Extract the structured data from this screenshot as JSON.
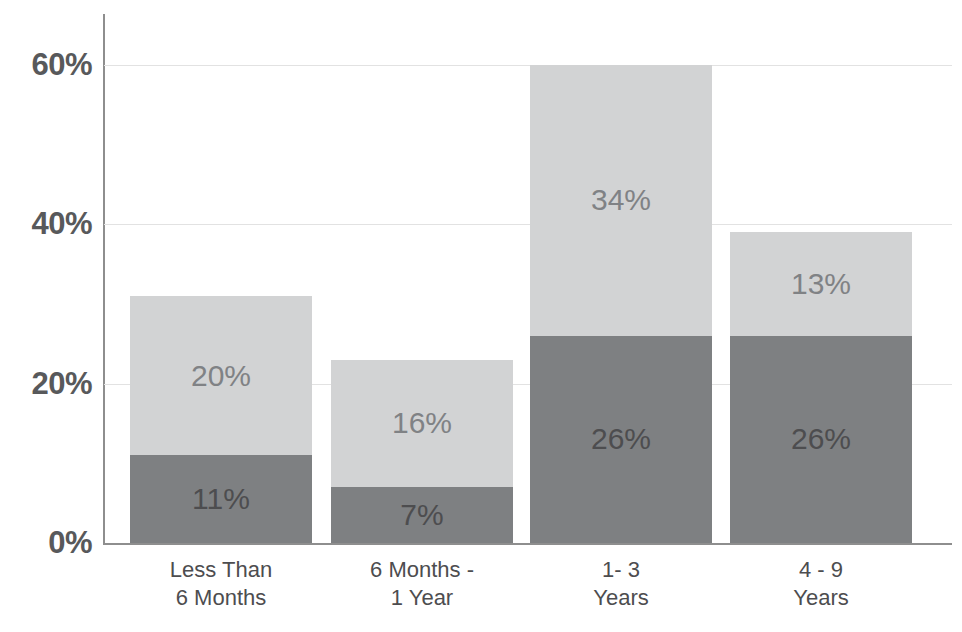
{
  "chart_data": {
    "type": "bar",
    "subtype": "stacked-bar",
    "title": "",
    "xlabel": "",
    "ylabel": "",
    "ylim": [
      0,
      63
    ],
    "grid": true,
    "legend": "none",
    "y_ticks": [
      "0%",
      "20%",
      "40%",
      "60%"
    ],
    "y_tick_values": [
      0,
      20,
      40,
      60
    ],
    "categories": [
      "Less Than\n6 Months",
      "6 Months -\n1 Year",
      "1- 3\nYears",
      "4 - 9\nYears"
    ],
    "series": [
      {
        "name": "dark",
        "color": "#7e8082",
        "values": [
          11,
          7,
          26,
          26
        ],
        "labels": [
          "11%",
          "7%",
          "26%",
          "26%"
        ]
      },
      {
        "name": "light",
        "color": "#d2d3d4",
        "values": [
          20,
          16,
          34,
          13
        ],
        "labels": [
          "20%",
          "16%",
          "34%",
          "13%"
        ]
      }
    ],
    "totals": [
      31,
      23,
      60,
      39
    ]
  },
  "style": {
    "background": "#ffffff",
    "axis_color": "#8e8e8e",
    "gridline_color": "#e2e2e2",
    "tick_text_color": "#58595b",
    "category_text_color": "#4d4d4f",
    "light_segment_color": "#d2d3d4",
    "dark_segment_color": "#7e8082",
    "light_label_color": "#808285",
    "dark_label_color": "#4d4d4f"
  }
}
